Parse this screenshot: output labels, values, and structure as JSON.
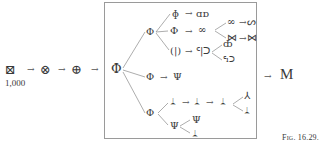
{
  "figure": {
    "caption": "Fig. 16.29.",
    "start": {
      "glyph": "⊠",
      "label": "1,000"
    },
    "chain": [
      "⊗",
      "⊕"
    ],
    "arrow": "→",
    "result": "M",
    "tree": {
      "root": "Φ",
      "branch_upper": {
        "node": "Φ",
        "children": [
          {
            "node": "ɸ",
            "next": "ɑɒ"
          },
          {
            "node": "Ф",
            "next": "∞",
            "children": [
              {
                "node": "∞",
                "next": "ᔕ"
              },
              {
                "node": "⋈",
                "next": "⋈"
              }
            ]
          },
          {
            "node": "(|)",
            "next": "ᑦ|ᑐ",
            "children": [
              {
                "node": "ȸ"
              },
              {
                "node": "ᑦıᑐ"
              }
            ]
          }
        ]
      },
      "branch_middle": {
        "node": "Φ",
        "next": "Ψ"
      },
      "branch_lower": {
        "node": "Φ",
        "children": [
          {
            "node": "ᛦ",
            "chain": [
              "ᛦ",
              "ᛦ",
              "ᛦ"
            ],
            "ends": [
              "⅄",
              "ᛦ"
            ]
          },
          {
            "node": "Ψ",
            "children": [
              {
                "node": "Ψ"
              },
              {
                "node": "ᛦ"
              }
            ]
          }
        ]
      }
    }
  }
}
